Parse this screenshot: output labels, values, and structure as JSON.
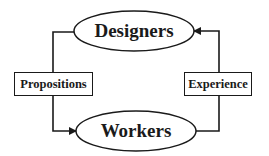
{
  "diagram": {
    "type": "cycle",
    "nodes": [
      {
        "id": "designers",
        "label": "Designers",
        "shape": "ellipse"
      },
      {
        "id": "workers",
        "label": "Workers",
        "shape": "ellipse"
      }
    ],
    "edges": [
      {
        "from": "designers",
        "to": "workers",
        "label": "Propositions",
        "side": "left"
      },
      {
        "from": "workers",
        "to": "designers",
        "label": "Experience",
        "side": "right"
      }
    ],
    "colors": {
      "stroke": "#1a1a1a",
      "fill": "#ffffff"
    }
  }
}
